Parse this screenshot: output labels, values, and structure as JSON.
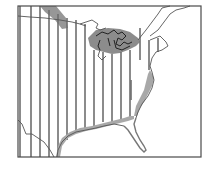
{
  "map": {
    "type": "species range map",
    "region": "Eastern North America",
    "colors": {
      "background": "#ffffff",
      "frame": "#4a4a4a",
      "outline": "#555555",
      "hatch": "#6e6e6e",
      "shaded_range": "#8c8c8c",
      "coast_band": "#a8a8a8"
    },
    "frame": {
      "x": 18,
      "y": 6,
      "width": 183,
      "height": 151
    },
    "hatch_lines_x": [
      20,
      31,
      40,
      49,
      58,
      67,
      76,
      85,
      94,
      103,
      112,
      121,
      130,
      140,
      149,
      158
    ],
    "legend": {
      "hatched_area": "range (vertical hatching)",
      "shaded_area": "dense range (gray shading)"
    },
    "features": [
      "Great Lakes",
      "Gulf Coast",
      "Atlantic Coast",
      "Florida peninsula",
      "Chesapeake Bay",
      "Texas–Mexico border",
      "US–Canada border"
    ]
  }
}
